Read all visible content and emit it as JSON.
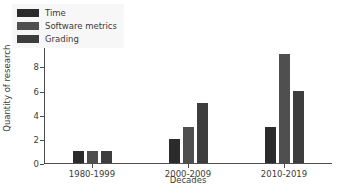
{
  "chart_data": {
    "type": "bar",
    "title": "",
    "xlabel": "Decades",
    "ylabel": "Quantity of research",
    "categories": [
      "1980-1999",
      "2000-2009",
      "2010-2019"
    ],
    "series": [
      {
        "name": "Time",
        "values": [
          1,
          2,
          3
        ],
        "color": "#2b2b2b"
      },
      {
        "name": "Software metrics",
        "values": [
          1,
          3,
          9
        ],
        "color": "#4f4f4f"
      },
      {
        "name": "Grading",
        "values": [
          1,
          5,
          6
        ],
        "color": "#3d3d3d"
      }
    ],
    "ylim": [
      0,
      12.6
    ],
    "yticks": [
      0,
      2,
      4,
      6,
      8,
      10,
      12
    ],
    "ytick_labels": [
      "0",
      "2",
      "4",
      "6",
      "8",
      "10",
      "12"
    ],
    "grid": false,
    "legend_position": "upper left",
    "legend_facecolor": "#f7f7f7",
    "axis_color": "#4d4d4d",
    "text_color": "#3b3b3b",
    "background": "#ffffff"
  }
}
